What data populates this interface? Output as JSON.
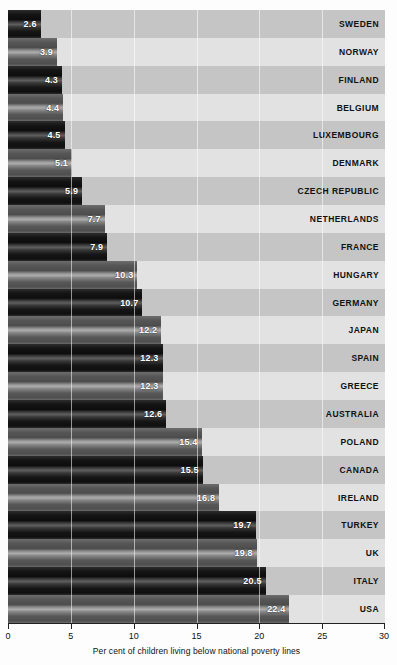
{
  "chart_data": {
    "type": "bar",
    "orientation": "horizontal",
    "title": "",
    "subtitle": "",
    "xlabel": "Per cent of children living below national poverty lines",
    "ylabel": "",
    "xlim": [
      0,
      30
    ],
    "xticks": [
      0,
      5,
      10,
      15,
      20,
      25,
      30
    ],
    "xtick_labels": [
      "0",
      "5",
      "10",
      "15",
      "20",
      "25",
      "30"
    ],
    "grid": true,
    "grid_axis": "x",
    "legend": false,
    "categories": [
      "SWEDEN",
      "NORWAY",
      "FINLAND",
      "BELGIUM",
      "LUXEMBOURG",
      "DENMARK",
      "CZECH REPUBLIC",
      "NETHERLANDS",
      "FRANCE",
      "HUNGARY",
      "GERMANY",
      "JAPAN",
      "SPAIN",
      "GREECE",
      "AUSTRALIA",
      "POLAND",
      "CANADA",
      "IRELAND",
      "TURKEY",
      "UK",
      "ITALY",
      "USA",
      "MEXICO"
    ],
    "values": [
      2.6,
      3.9,
      4.3,
      4.4,
      4.5,
      5.1,
      5.9,
      7.7,
      7.9,
      10.3,
      10.7,
      12.2,
      12.3,
      12.3,
      12.6,
      15.4,
      15.5,
      16.8,
      19.7,
      19.8,
      20.5,
      22.4,
      26.2
    ],
    "value_labels": [
      "2.6",
      "3.9",
      "4.3",
      "4.4",
      "4.5",
      "5.1",
      "5.9",
      "7.7",
      "7.9",
      "10.3",
      "10.7",
      "12.2",
      "12.3",
      "12.3",
      "12.6",
      "15.4",
      "15.5",
      "16.8",
      "19.7",
      "19.8",
      "20.5",
      "22.4",
      "26.2"
    ],
    "rows": [
      {
        "label": "SWEDEN",
        "value": 2.6,
        "value_label": "2.6"
      },
      {
        "label": "NORWAY",
        "value": 3.9,
        "value_label": "3.9"
      },
      {
        "label": "FINLAND",
        "value": 4.3,
        "value_label": "4.3"
      },
      {
        "label": "BELGIUM",
        "value": 4.4,
        "value_label": "4.4"
      },
      {
        "label": "LUXEMBOURG",
        "value": 4.5,
        "value_label": "4.5"
      },
      {
        "label": "DENMARK",
        "value": 5.1,
        "value_label": "5.1"
      },
      {
        "label": "CZECH REPUBLIC",
        "value": 5.9,
        "value_label": "5.9"
      },
      {
        "label": "NETHERLANDS",
        "value": 7.7,
        "value_label": "7.7"
      },
      {
        "label": "FRANCE",
        "value": 7.9,
        "value_label": "7.9"
      },
      {
        "label": "HUNGARY",
        "value": 10.3,
        "value_label": "10.3"
      },
      {
        "label": "GERMANY",
        "value": 10.7,
        "value_label": "10.7"
      },
      {
        "label": "JAPAN",
        "value": 12.2,
        "value_label": "12.2"
      },
      {
        "label": "SPAIN",
        "value": 12.3,
        "value_label": "12.3"
      },
      {
        "label": "GREECE",
        "value": 12.3,
        "value_label": "12.3"
      },
      {
        "label": "AUSTRALIA",
        "value": 12.6,
        "value_label": "12.6"
      },
      {
        "label": "POLAND",
        "value": 15.4,
        "value_label": "15.4"
      },
      {
        "label": "CANADA",
        "value": 15.5,
        "value_label": "15.5"
      },
      {
        "label": "IRELAND",
        "value": 16.8,
        "value_label": "16.8"
      },
      {
        "label": "TURKEY",
        "value": 19.7,
        "value_label": "19.7"
      },
      {
        "label": "UK",
        "value": 19.8,
        "value_label": "19.8"
      },
      {
        "label": "ITALY",
        "value": 20.5,
        "value_label": "20.5"
      },
      {
        "label": "USA",
        "value": 22.4,
        "value_label": "22.4"
      },
      {
        "label": "MEXICO",
        "value": 26.2,
        "value_label": "26.2"
      }
    ],
    "colors": {
      "band_dark": "#c5c5c5",
      "band_light": "#e2e2e2",
      "bar_dark": "#121212",
      "bar_light": "#5a5a5a",
      "value_text": "#ffffff",
      "label_text": "#111111",
      "axis": "#222222",
      "gridline": "#ffffff",
      "page_background": "#fdfdfd"
    }
  }
}
